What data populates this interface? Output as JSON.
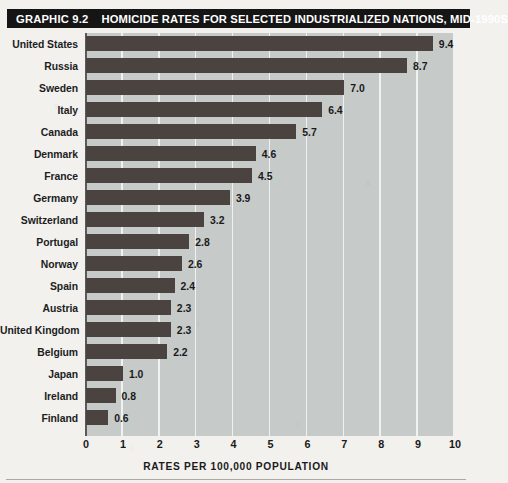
{
  "header": {
    "graphic_number": "GRAPHIC 9.2",
    "title": "HOMICIDE RATES FOR SELECTED INDUSTRIALIZED NATIONS, MID-1990S"
  },
  "colors": {
    "title_band_bg": "#151515",
    "title_band_text": "#ffffff",
    "plot_bg": "#c6cac9",
    "bar": "#4b4340",
    "gridline": "#f0f2f1",
    "page_bg": "#f2f1ee",
    "text": "#1a1a1a"
  },
  "chart_data": {
    "type": "bar",
    "orientation": "horizontal",
    "title": "HOMICIDE RATES FOR SELECTED INDUSTRIALIZED NATIONS, MID-1990S",
    "xlabel": "RATES PER 100,000 POPULATION",
    "ylabel": "",
    "xlim": [
      0,
      10
    ],
    "xticks": [
      "0",
      "1",
      "2",
      "3",
      "4",
      "5",
      "6",
      "7",
      "8",
      "9",
      "10"
    ],
    "grid": true,
    "legend": false,
    "categories": [
      "United States",
      "Russia",
      "Sweden",
      "Italy",
      "Canada",
      "Denmark",
      "France",
      "Germany",
      "Switzerland",
      "Portugal",
      "Norway",
      "Spain",
      "Austria",
      "United Kingdom",
      "Belgium",
      "Japan",
      "Ireland",
      "Finland"
    ],
    "values": [
      9.4,
      8.7,
      7.0,
      6.4,
      5.7,
      4.6,
      4.5,
      3.9,
      3.2,
      2.8,
      2.6,
      2.4,
      2.3,
      2.3,
      2.2,
      1.0,
      0.8,
      0.6
    ],
    "value_labels": [
      "9.4",
      "8.7",
      "7.0",
      "6.4",
      "5.7",
      "4.6",
      "4.5",
      "3.9",
      "3.2",
      "2.8",
      "2.6",
      "2.4",
      "2.3",
      "2.3",
      "2.2",
      "1.0",
      "0.8",
      "0.6"
    ]
  }
}
